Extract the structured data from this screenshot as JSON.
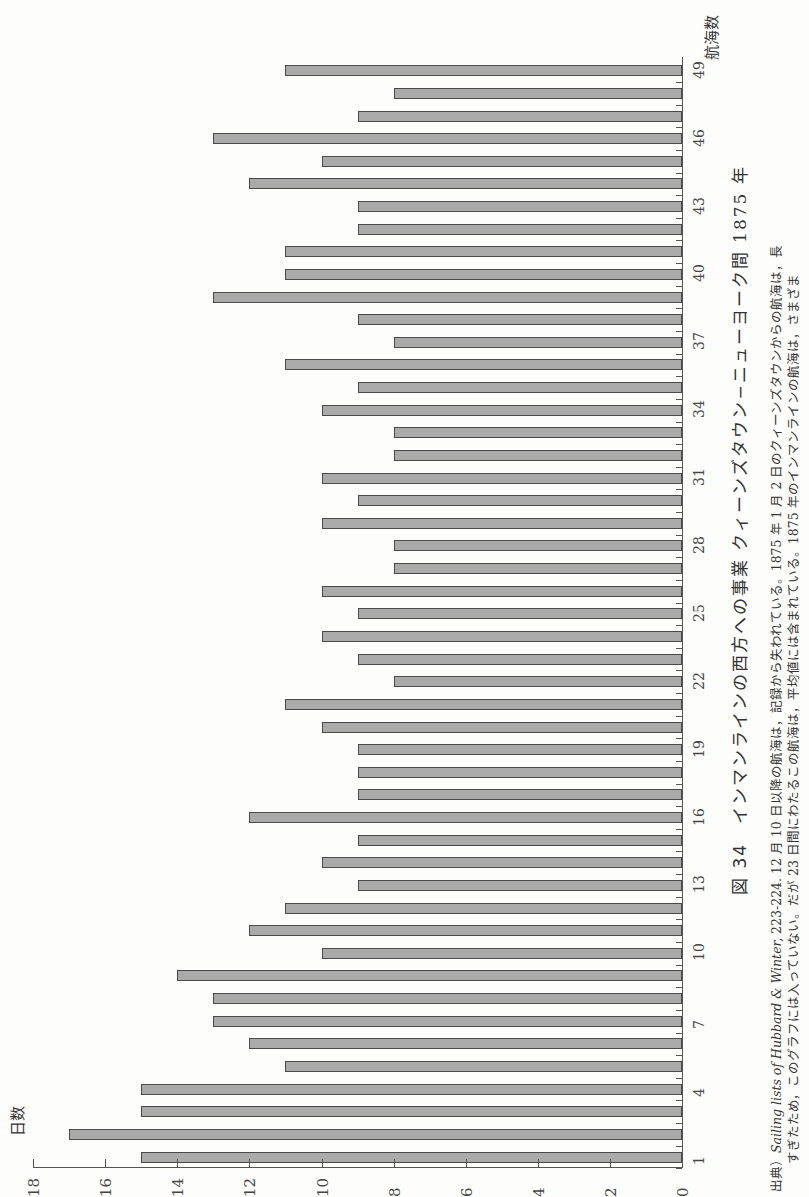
{
  "figure": {
    "number_label": "図 34",
    "title": "インマンラインの西方への事業 クィーンズタウン−ニューヨーク間 1875 年",
    "source_prefix": "出典）",
    "source_italic": "Sailing lists of Hubbard & Winter,",
    "source_line1_rest": " 223-224. 12 月 10 日以降の航海は，記録から失われている。1875 年 1 月 2 日のクィーンズタウンからの航海は，長",
    "source_line2": "すぎたため，このグラフには入っていない。だが 23 日間にわたるこの航海は，平均値には含まれている。1875 年のインマンラインの航海は，さまざま"
  },
  "chart_data": {
    "type": "bar",
    "orientation": "horizontal (page rotated 90° clockwise)",
    "title": "インマンラインの西方への事業 クィーンズタウン−ニューヨーク間 1875 年",
    "xlabel": "航海数",
    "ylabel": "日数",
    "ylim": [
      0,
      18
    ],
    "value_ticks": [
      0,
      2,
      4,
      6,
      8,
      10,
      12,
      14,
      16,
      18
    ],
    "category_tick_labels": [
      "1",
      "4",
      "7",
      "10",
      "13",
      "16",
      "19",
      "22",
      "25",
      "28",
      "31",
      "34",
      "37",
      "40",
      "43",
      "46",
      "49"
    ],
    "categories": [
      1,
      2,
      3,
      4,
      5,
      6,
      7,
      8,
      9,
      10,
      11,
      12,
      13,
      14,
      15,
      16,
      17,
      18,
      19,
      20,
      21,
      22,
      23,
      24,
      25,
      26,
      27,
      28,
      29,
      30,
      31,
      32,
      33,
      34,
      35,
      36,
      37,
      38,
      39,
      40,
      41,
      42,
      43,
      44,
      45,
      46,
      47,
      48,
      49
    ],
    "values": [
      15,
      17,
      15,
      15,
      11,
      12,
      13,
      13,
      14,
      10,
      12,
      11,
      9,
      10,
      9,
      12,
      9,
      9,
      9,
      10,
      11,
      8,
      9,
      10,
      9,
      10,
      8,
      8,
      10,
      9,
      10,
      8,
      8,
      10,
      9,
      11,
      8,
      9,
      13,
      11,
      11,
      9,
      9,
      12,
      10,
      13,
      9,
      8,
      11
    ],
    "grid": false,
    "bar_color": "#aaaaaa",
    "bar_edge_color": "#4a4a4a"
  }
}
